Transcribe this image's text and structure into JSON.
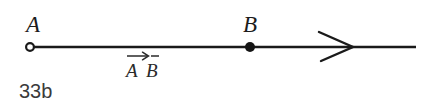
{
  "figure": {
    "caption": "33b",
    "stroke_color": "#1a1a1a",
    "background_color": "#ffffff",
    "points": [
      {
        "name": "point-a",
        "label": "A",
        "marker": "open-circle",
        "x": 30,
        "y": 47
      },
      {
        "name": "point-b",
        "label": "B",
        "marker": "filled-dot",
        "x": 250,
        "y": 47
      }
    ],
    "ray": {
      "start_x": 30,
      "end_x": 416,
      "y": 47,
      "arrowhead_x": 352,
      "direction": "right"
    },
    "vector_label": {
      "text": "A B",
      "notation": "arrow-overbar",
      "x": 126,
      "y": 50
    }
  }
}
